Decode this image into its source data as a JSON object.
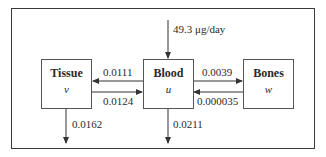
{
  "diagram": {
    "type": "compartment-flow",
    "compartments": [
      {
        "id": "tissue",
        "title": "Tissue",
        "variable": "v"
      },
      {
        "id": "blood",
        "title": "Blood",
        "variable": "u"
      },
      {
        "id": "bones",
        "title": "Bones",
        "variable": "w"
      }
    ],
    "flows": {
      "input_to_blood": "49.3 μg/day",
      "blood_to_tissue": "0.0111",
      "tissue_to_blood": "0.0124",
      "blood_to_bones": "0.0039",
      "bones_to_blood": "0.000035",
      "tissue_out": "0.0162",
      "blood_out": "0.0211"
    },
    "colors": {
      "line": "#3a3a3a",
      "background": "#ffffff"
    }
  }
}
